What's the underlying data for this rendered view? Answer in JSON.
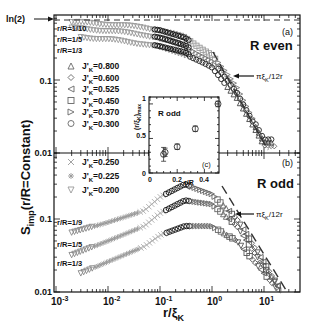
{
  "chart_data": [
    {
      "panel": "(a)",
      "type": "scatter",
      "title": "R even",
      "xlabel": "r/ξ_K",
      "ylabel": "S_imp(r/R=Constant)",
      "xscale": "log",
      "yscale": "log",
      "xlim": [
        0.001,
        50
      ],
      "ylim": [
        0.01,
        1
      ],
      "reference_line": {
        "label": "ln(2)",
        "y": 0.693,
        "style": "dashed"
      },
      "asymptote": {
        "label": "πξ_K/12r",
        "style": "dashed"
      },
      "curve_labels": [
        "r/R=1/10",
        "r/R=1/5",
        "r/R=1/3"
      ],
      "legend": [
        {
          "marker": "triangle-up",
          "label": "J'_K=0.800"
        },
        {
          "marker": "diamond",
          "label": "J'_K=0.600"
        },
        {
          "marker": "triangle-left",
          "label": "J'_K=0.525"
        },
        {
          "marker": "square",
          "label": "J'_K=0.450"
        },
        {
          "marker": "triangle-right",
          "label": "J'_K=0.370"
        },
        {
          "marker": "circle",
          "label": "J'_K=0.300"
        }
      ],
      "series": [
        {
          "name": "r/R=1/10",
          "x": [
            0.002,
            0.01,
            0.05,
            0.1,
            0.3,
            1,
            3,
            10
          ],
          "y": [
            0.62,
            0.58,
            0.52,
            0.48,
            0.38,
            0.22,
            0.08,
            0.015
          ]
        },
        {
          "name": "r/R=1/5",
          "x": [
            0.002,
            0.01,
            0.05,
            0.1,
            0.3,
            1,
            3,
            10
          ],
          "y": [
            0.52,
            0.48,
            0.42,
            0.38,
            0.3,
            0.18,
            0.07,
            0.014
          ]
        },
        {
          "name": "r/R=1/3",
          "x": [
            0.003,
            0.01,
            0.05,
            0.1,
            0.3,
            1,
            3,
            10
          ],
          "y": [
            0.4,
            0.37,
            0.32,
            0.29,
            0.24,
            0.15,
            0.06,
            0.013
          ]
        }
      ]
    },
    {
      "panel": "(b)",
      "type": "scatter",
      "title": "R odd",
      "xlabel": "r/ξ_K",
      "xscale": "log",
      "yscale": "log",
      "xlim": [
        0.001,
        50
      ],
      "ylim": [
        0.01,
        1
      ],
      "asymptote": {
        "label": "πξ_K/12r",
        "style": "dashed"
      },
      "curve_labels": [
        "r/R=1/9",
        "r/R=1/5",
        "r/R=1/3"
      ],
      "legend": [
        {
          "marker": "cross",
          "label": "J'_K=0.250"
        },
        {
          "marker": "asterisk",
          "label": "J'_K=0.225"
        },
        {
          "marker": "triangle-down",
          "label": "J'_K=0.200"
        }
      ],
      "series": [
        {
          "name": "r/R=1/9",
          "x": [
            0.002,
            0.01,
            0.05,
            0.1,
            0.3,
            1,
            3,
            10,
            20
          ],
          "y": [
            0.065,
            0.09,
            0.13,
            0.2,
            0.3,
            0.22,
            0.1,
            0.025,
            0.011
          ]
        },
        {
          "name": "r/R=1/5",
          "x": [
            0.002,
            0.01,
            0.05,
            0.1,
            0.3,
            1,
            3,
            10,
            20
          ],
          "y": [
            0.032,
            0.05,
            0.08,
            0.12,
            0.18,
            0.16,
            0.08,
            0.022,
            0.011
          ]
        },
        {
          "name": "r/R=1/3",
          "x": [
            0.003,
            0.01,
            0.05,
            0.1,
            0.3,
            1,
            3,
            10,
            20
          ],
          "y": [
            0.018,
            0.026,
            0.042,
            0.06,
            0.08,
            0.08,
            0.05,
            0.018,
            0.01
          ]
        }
      ]
    },
    {
      "panel": "(c)",
      "type": "scatter",
      "title": "R odd",
      "xlabel": "r/R",
      "ylabel": "(r/ξ_K)_max",
      "xlim": [
        0,
        0.5
      ],
      "ylim": [
        0,
        1.1
      ],
      "xticks": [
        "0",
        "0.2",
        "0.4"
      ],
      "yticks": [
        "0",
        "0.5",
        "1"
      ],
      "x": [
        0.1,
        0.111,
        0.2,
        0.333,
        0.5
      ],
      "y": [
        0.27,
        0.3,
        0.38,
        0.64,
        1.0
      ],
      "error": [
        0.1,
        0.06,
        0.04,
        0.04,
        0.04
      ]
    }
  ],
  "labels": {
    "ln2": "ln(2)",
    "panel_a": "(a)",
    "panel_b": "(b)",
    "panel_c": "(c)",
    "r_even": "R even",
    "r_odd": "R odd",
    "inset_title": "R odd",
    "asym": "πξ",
    "asym_sub": "K",
    "asym_tail": "/12r",
    "ytick_01": "0.1",
    "ytick_001": "0.01",
    "xticks": [
      "10",
      "10",
      "10",
      "10",
      "10"
    ],
    "xtick_exp": [
      "-3",
      "-2",
      "-1",
      "0",
      "1"
    ],
    "xlabel_main": "r/ξ",
    "xlabel_sub": "K",
    "ylabel_S": "S",
    "ylabel_sub": "imp",
    "ylabel_tail": "(r/R=Constant)",
    "top_curves": [
      "r/R=1/10",
      "r/R=1/5",
      "r/R=1/3"
    ],
    "bottom_curves": [
      "r/R=1/9",
      "r/R=1/5",
      "r/R=1/3"
    ],
    "legend_top": [
      "=0.800",
      "=0.600",
      "=0.525",
      "=0.450",
      "=0.370",
      "=0.300"
    ],
    "legend_bottom": [
      "=0.250",
      "=0.225",
      "=0.200"
    ],
    "legend_J": "J'",
    "legend_K": "K",
    "inset_xlabel": "r/R",
    "inset_xticks": [
      "0",
      "0.2",
      "0.4"
    ],
    "inset_yticks": [
      "0",
      "0.5",
      "1"
    ],
    "inset_ylabel": "(r/ξ",
    "inset_ylabel_sub": "K",
    "inset_ylabel_tail": ")",
    "inset_ylabel_max": "max"
  }
}
